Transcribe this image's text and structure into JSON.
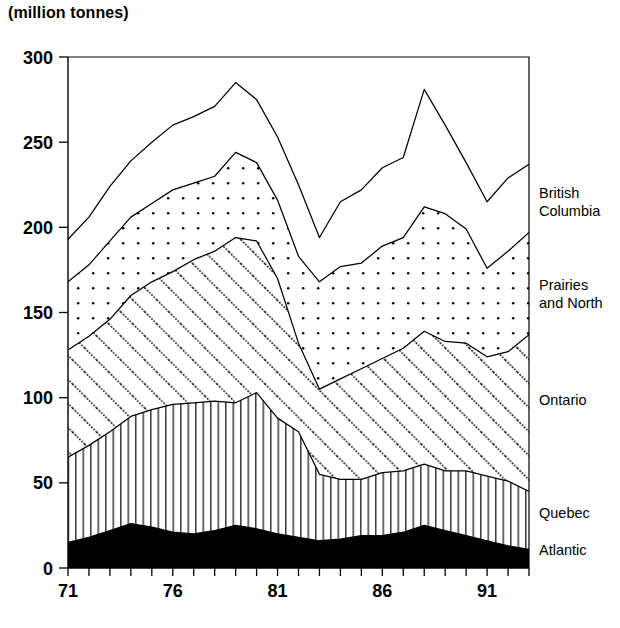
{
  "title": "(million tonnes)",
  "chart_data": {
    "type": "area",
    "title": "(million tonnes)",
    "subtitle": "",
    "xlabel": "",
    "ylabel": "million tonnes",
    "stacked": true,
    "grid": false,
    "legend_position": "right",
    "xlim": [
      71,
      93
    ],
    "ylim": [
      0,
      300
    ],
    "yticks": [
      0,
      50,
      100,
      150,
      200,
      250,
      300
    ],
    "ytick_labels": [
      "0",
      "50",
      "100",
      "150",
      "200",
      "250",
      "300"
    ],
    "xticks": [
      71,
      72,
      73,
      74,
      75,
      76,
      77,
      78,
      79,
      80,
      81,
      82,
      83,
      84,
      85,
      86,
      87,
      88,
      89,
      90,
      91,
      92,
      93
    ],
    "xtick_labels_shown": [
      "71",
      "76",
      "81",
      "86",
      "91"
    ],
    "xtick_labels_shown_at": [
      71,
      76,
      81,
      86,
      91
    ],
    "x": [
      71,
      72,
      73,
      74,
      75,
      76,
      77,
      78,
      79,
      80,
      81,
      82,
      83,
      84,
      85,
      86,
      87,
      88,
      89,
      90,
      91,
      92,
      93
    ],
    "series": [
      {
        "name": "Atlantic",
        "pattern": "solid-black",
        "values": [
          15,
          18,
          22,
          26,
          24,
          21,
          20,
          22,
          25,
          23,
          20,
          18,
          16,
          17,
          19,
          19,
          21,
          25,
          22,
          19,
          16,
          13,
          11
        ]
      },
      {
        "name": "Quebec",
        "pattern": "vertical-lines",
        "values": [
          50,
          54,
          58,
          63,
          69,
          75,
          77,
          76,
          72,
          80,
          68,
          62,
          39,
          35,
          33,
          37,
          36,
          36,
          35,
          38,
          38,
          38,
          34
        ]
      },
      {
        "name": "Ontario",
        "pattern": "diagonal-hatch",
        "values": [
          63,
          64,
          66,
          71,
          75,
          78,
          84,
          88,
          97,
          89,
          82,
          52,
          50,
          59,
          65,
          67,
          72,
          78,
          76,
          75,
          70,
          76,
          92
        ]
      },
      {
        "name": "Prairies and North",
        "pattern": "dotted",
        "values": [
          40,
          42,
          46,
          46,
          46,
          48,
          45,
          44,
          50,
          46,
          46,
          51,
          63,
          66,
          62,
          66,
          65,
          73,
          75,
          67,
          52,
          59,
          60
        ]
      },
      {
        "name": "British Columbia",
        "pattern": "white",
        "values": [
          25,
          28,
          32,
          33,
          36,
          38,
          39,
          41,
          41,
          37,
          37,
          42,
          26,
          38,
          43,
          46,
          47,
          69,
          52,
          39,
          39,
          43,
          40
        ]
      }
    ],
    "cumulative_tops": {
      "Atlantic": [
        15,
        18,
        22,
        26,
        24,
        21,
        20,
        22,
        25,
        23,
        20,
        18,
        16,
        17,
        19,
        19,
        21,
        25,
        22,
        19,
        16,
        13,
        11
      ],
      "Quebec": [
        65,
        72,
        80,
        89,
        93,
        96,
        97,
        98,
        97,
        103,
        88,
        80,
        55,
        52,
        52,
        56,
        57,
        61,
        57,
        57,
        54,
        51,
        45
      ],
      "Ontario": [
        128,
        136,
        146,
        160,
        168,
        174,
        181,
        186,
        194,
        192,
        170,
        132,
        105,
        111,
        117,
        123,
        129,
        139,
        133,
        132,
        124,
        127,
        137
      ],
      "Prairies and North": [
        168,
        178,
        192,
        206,
        214,
        222,
        226,
        230,
        244,
        238,
        216,
        183,
        168,
        177,
        179,
        189,
        194,
        212,
        208,
        199,
        176,
        186,
        197
      ],
      "Total": [
        193,
        206,
        224,
        239,
        250,
        260,
        265,
        271,
        285,
        275,
        253,
        225,
        194,
        215,
        222,
        235,
        241,
        281,
        260,
        238,
        215,
        229,
        237
      ]
    }
  },
  "legend": {
    "items": [
      {
        "label_line1": "British",
        "label_line2": "Columbia"
      },
      {
        "label_line1": "Prairies",
        "label_line2": "and North"
      },
      {
        "label_line1": "Ontario",
        "label_line2": ""
      },
      {
        "label_line1": "Quebec",
        "label_line2": ""
      },
      {
        "label_line1": "Atlantic",
        "label_line2": ""
      }
    ]
  }
}
